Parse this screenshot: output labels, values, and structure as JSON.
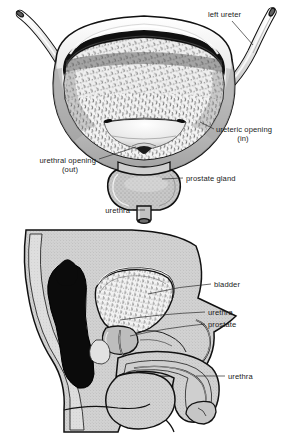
{
  "page": {
    "background_color": "#ffffff",
    "width": 288,
    "height": 434
  },
  "colors": {
    "ink": "#111111",
    "label_text": "#1a1a1a",
    "leader_line": "#2b2b2b",
    "tissue_gray": "#c9c9c9",
    "tissue_gray_light": "#d9d9d9",
    "prostate_fill": "#c4c4c4",
    "mucosa_fill": "#f2f2f2",
    "dark_shadow": "#0d0d0d",
    "ureter_fill": "#dcdcdc",
    "background": "#ffffff"
  },
  "figures": [
    {
      "id": "bladder-anterior",
      "name": "Bladder interior, anterior cut-away view",
      "labels": [
        {
          "id": "left-ureter",
          "line1": "left ureter",
          "line2": "",
          "text_x": 208,
          "text_y": 17,
          "anchor": "start",
          "leader": "M 232 21 L 253 45"
        },
        {
          "id": "ureteric-opening",
          "line1": "ureteric opening",
          "line2": "(in)",
          "text_x": 216,
          "text_y": 132,
          "anchor": "start",
          "leader": "M 214 129 L 202 123"
        },
        {
          "id": "urethral-opening",
          "line1": "urethral opening",
          "line2": "(out)",
          "text_x": 96,
          "text_y": 163,
          "anchor": "end",
          "leader": "M 99 160 L 136 148"
        },
        {
          "id": "prostate-gland",
          "line1": "prostate gland",
          "line2": "",
          "text_x": 186,
          "text_y": 181,
          "anchor": "start",
          "leader": "M 183 178 L 160 176"
        },
        {
          "id": "urethra",
          "line1": "urethra",
          "line2": "",
          "text_x": 130,
          "text_y": 213,
          "anchor": "end",
          "leader": "M 133 210 L 146 210"
        }
      ]
    },
    {
      "id": "male-pelvis-sagittal",
      "name": "Male pelvis, mid-sagittal section",
      "labels": [
        {
          "id": "bladder",
          "line1": "bladder",
          "line2": "",
          "text_x": 214,
          "text_y": 59,
          "anchor": "start",
          "leader": "M 211 56 L 148 68"
        },
        {
          "id": "urethra-prostatic",
          "line1": "urethra",
          "line2": "",
          "text_x": 208,
          "text_y": 87,
          "anchor": "start",
          "leader": "M 205 84 L 118 90"
        },
        {
          "id": "prostate",
          "line1": "prostate",
          "line2": "",
          "text_x": 208,
          "text_y": 99,
          "anchor": "start",
          "leader": "M 205 96 L 126 102"
        },
        {
          "id": "urethra-penile",
          "line1": "urethra",
          "line2": "",
          "text_x": 228,
          "text_y": 151,
          "anchor": "start",
          "leader": "M 225 148 L 190 148"
        }
      ]
    }
  ]
}
